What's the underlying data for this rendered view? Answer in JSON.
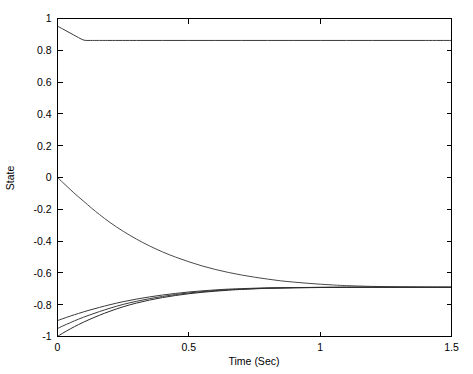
{
  "chart_data": {
    "type": "line",
    "title": "",
    "subtitle": "",
    "xlabel": "Time (Sec)",
    "ylabel": "State",
    "xlim": [
      0,
      1.5
    ],
    "ylim": [
      -1,
      1
    ],
    "grid": false,
    "legend": null,
    "legend_position": "none",
    "xticks": [
      0,
      0.5,
      1,
      1.5
    ],
    "xtick_labels": [
      "0",
      "0.5",
      "1",
      "1.5"
    ],
    "yticks": [
      -1,
      -0.8,
      -0.6,
      -0.4,
      -0.2,
      0,
      0.2,
      0.4,
      0.6,
      0.8,
      1
    ],
    "ytick_labels": [
      "-1",
      "-0.8",
      "-0.6",
      "-0.4",
      "-0.2",
      "0",
      "0.2",
      "0.4",
      "0.6",
      "0.8",
      "1"
    ],
    "box": true,
    "line_color": "#3a3a3a",
    "series": [
      {
        "name": "state-1",
        "color": "#3a3a3a",
        "x": [
          0,
          0.02,
          0.04,
          0.06,
          0.08,
          0.1,
          0.12,
          0.15,
          0.2,
          0.3,
          0.4,
          0.5,
          0.6,
          0.7,
          0.8,
          0.9,
          1.0,
          1.1,
          1.2,
          1.3,
          1.4,
          1.5
        ],
        "y": [
          0.952,
          0.934,
          0.916,
          0.898,
          0.88,
          0.864,
          0.862,
          0.862,
          0.862,
          0.862,
          0.862,
          0.862,
          0.862,
          0.862,
          0.862,
          0.862,
          0.862,
          0.862,
          0.862,
          0.862,
          0.862,
          0.862
        ]
      },
      {
        "name": "state-2",
        "color": "#4a4a4a",
        "x": [
          0,
          0.02,
          0.04,
          0.06,
          0.08,
          0.1,
          0.13,
          0.16,
          0.2,
          0.25,
          0.3,
          0.35,
          0.4,
          0.45,
          0.5,
          0.55,
          0.6,
          0.65,
          0.7,
          0.75,
          0.8,
          0.85,
          0.9,
          0.95,
          1.0,
          1.05,
          1.1,
          1.2,
          1.3,
          1.4,
          1.5
        ],
        "y": [
          0.0,
          -0.031,
          -0.062,
          -0.093,
          -0.122,
          -0.15,
          -0.193,
          -0.233,
          -0.283,
          -0.338,
          -0.387,
          -0.43,
          -0.468,
          -0.501,
          -0.53,
          -0.556,
          -0.578,
          -0.597,
          -0.613,
          -0.627,
          -0.639,
          -0.65,
          -0.658,
          -0.665,
          -0.671,
          -0.676,
          -0.68,
          -0.685,
          -0.688,
          -0.69,
          -0.691
        ]
      },
      {
        "name": "state-3",
        "color": "#3a3a3a",
        "x": [
          0,
          0.02,
          0.05,
          0.08,
          0.12,
          0.16,
          0.2,
          0.25,
          0.3,
          0.35,
          0.4,
          0.45,
          0.5,
          0.55,
          0.6,
          0.65,
          0.7,
          0.8,
          0.9,
          1.0,
          1.1,
          1.2,
          1.3,
          1.4,
          1.5
        ],
        "y": [
          -0.9,
          -0.888,
          -0.871,
          -0.855,
          -0.835,
          -0.817,
          -0.8,
          -0.781,
          -0.765,
          -0.751,
          -0.739,
          -0.729,
          -0.72,
          -0.713,
          -0.707,
          -0.702,
          -0.699,
          -0.694,
          -0.692,
          -0.691,
          -0.69,
          -0.69,
          -0.69,
          -0.69,
          -0.69
        ]
      },
      {
        "name": "state-4",
        "color": "#3a3a3a",
        "x": [
          0,
          0.02,
          0.05,
          0.08,
          0.12,
          0.16,
          0.2,
          0.25,
          0.3,
          0.35,
          0.4,
          0.45,
          0.5,
          0.55,
          0.6,
          0.65,
          0.7,
          0.8,
          0.9,
          1.0,
          1.1,
          1.2,
          1.3,
          1.4,
          1.5
        ],
        "y": [
          -0.95,
          -0.934,
          -0.912,
          -0.891,
          -0.866,
          -0.843,
          -0.822,
          -0.798,
          -0.779,
          -0.762,
          -0.748,
          -0.736,
          -0.726,
          -0.718,
          -0.711,
          -0.706,
          -0.702,
          -0.696,
          -0.693,
          -0.691,
          -0.69,
          -0.69,
          -0.69,
          -0.69,
          -0.69
        ]
      },
      {
        "name": "state-5",
        "color": "#2a2a2a",
        "x": [
          0,
          0.02,
          0.05,
          0.08,
          0.12,
          0.16,
          0.2,
          0.25,
          0.3,
          0.35,
          0.4,
          0.45,
          0.5,
          0.55,
          0.6,
          0.65,
          0.7,
          0.8,
          0.9,
          1.0,
          1.1,
          1.2,
          1.3,
          1.4,
          1.5
        ],
        "y": [
          -1.0,
          -0.979,
          -0.951,
          -0.925,
          -0.894,
          -0.866,
          -0.841,
          -0.813,
          -0.79,
          -0.771,
          -0.755,
          -0.742,
          -0.731,
          -0.722,
          -0.715,
          -0.709,
          -0.704,
          -0.697,
          -0.694,
          -0.692,
          -0.691,
          -0.69,
          -0.69,
          -0.69,
          -0.69
        ]
      }
    ]
  }
}
